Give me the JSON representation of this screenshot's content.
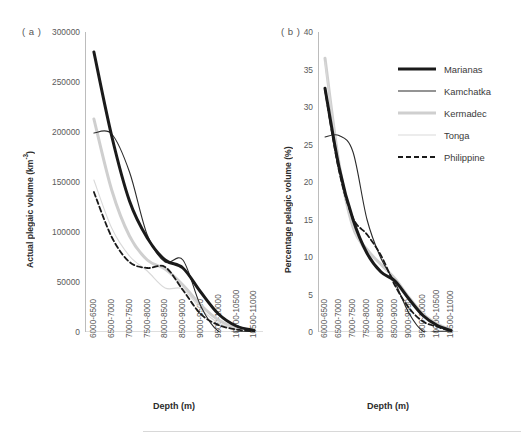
{
  "figure": {
    "panel_a_tag": "( a )",
    "panel_b_tag": "( b )",
    "legend": [
      {
        "label": "Marianas",
        "color": "#1a1a1a",
        "width": 3.0,
        "dash": "none"
      },
      {
        "label": "Kamchatka",
        "color": "#2b2b2b",
        "width": 1.1,
        "dash": "none"
      },
      {
        "label": "Kermadec",
        "color": "#cfcfcf",
        "width": 3.0,
        "dash": "none"
      },
      {
        "label": "Tonga",
        "color": "#d9d9d9",
        "width": 1.1,
        "dash": "none"
      },
      {
        "label": "Philippine",
        "color": "#1a1a1a",
        "width": 1.8,
        "dash": "5,3"
      }
    ]
  },
  "chart_data": [
    {
      "type": "line",
      "panel": "a",
      "title": "( a )",
      "xlabel": "Depth (m)",
      "ylabel": "Actual plegaic volume (km-3)",
      "ylim": [
        0,
        300000
      ],
      "yticks": [
        0,
        50000,
        100000,
        150000,
        200000,
        250000,
        300000
      ],
      "ytick_labels": [
        "0",
        "50000",
        "100000",
        "150000",
        "200000",
        "250000",
        "300000"
      ],
      "grid": false,
      "legend_position": "right",
      "categories": [
        "6000-6500",
        "6500-7000",
        "7000-7500",
        "7500-8000",
        "8000-8500",
        "8500-9000",
        "9000-9500",
        "9500-10000",
        "10000-10500",
        "10500-11000"
      ],
      "series": [
        {
          "name": "Marianas",
          "values": [
            280000,
            196000,
            131000,
            94000,
            72000,
            64000,
            40000,
            18000,
            6000,
            1500
          ]
        },
        {
          "name": "Kamchatka",
          "values": [
            199000,
            198000,
            160000,
            97000,
            70000,
            72000,
            26000,
            600,
            300,
            200
          ]
        },
        {
          "name": "Kermadec",
          "values": [
            213000,
            142000,
            96000,
            72000,
            63000,
            47000,
            27000,
            12000,
            4000,
            1200
          ]
        },
        {
          "name": "Tonga",
          "values": [
            152000,
            104000,
            76000,
            61000,
            44000,
            43000,
            23000,
            9000,
            3000,
            900
          ]
        },
        {
          "name": "Philippine",
          "values": [
            140000,
            95000,
            70000,
            64000,
            65000,
            42000,
            18000,
            7000,
            2500,
            600
          ]
        }
      ]
    },
    {
      "type": "line",
      "panel": "b",
      "title": "( b )",
      "xlabel": "Depth (m)",
      "ylabel": "Percentage pelagic volume (%)",
      "ylim": [
        0,
        40
      ],
      "yticks": [
        0,
        5,
        10,
        15,
        20,
        25,
        30,
        35,
        40
      ],
      "ytick_labels": [
        "0",
        "5",
        "10",
        "15",
        "20",
        "25",
        "30",
        "35",
        "40"
      ],
      "grid": false,
      "legend_position": "right",
      "categories": [
        "6000-6500",
        "6500-7000",
        "7000-7500",
        "7500-8000",
        "8000-8500",
        "8500-9000",
        "9000-9500",
        "9500-10000",
        "10000-10500",
        "10500-11000"
      ],
      "series": [
        {
          "name": "Marianas",
          "values": [
            32.5,
            22.0,
            15.0,
            10.5,
            8.0,
            6.8,
            4.4,
            2.2,
            0.9,
            0.2
          ]
        },
        {
          "name": "Kamchatka",
          "values": [
            26.0,
            26.2,
            24.0,
            15.0,
            9.8,
            6.6,
            2.5,
            0.1,
            0.1,
            0.1
          ]
        },
        {
          "name": "Kermadec",
          "values": [
            36.5,
            22.5,
            14.0,
            11.0,
            9.0,
            7.1,
            4.6,
            2.4,
            1.1,
            0.3
          ]
        },
        {
          "name": "Tonga",
          "values": [
            36.0,
            22.8,
            14.2,
            10.3,
            8.2,
            6.5,
            4.2,
            2.0,
            0.8,
            0.2
          ]
        },
        {
          "name": "Philippine",
          "values": [
            32.3,
            21.5,
            15.2,
            13.0,
            10.2,
            6.2,
            3.2,
            1.4,
            0.7,
            0.1
          ]
        }
      ]
    }
  ]
}
